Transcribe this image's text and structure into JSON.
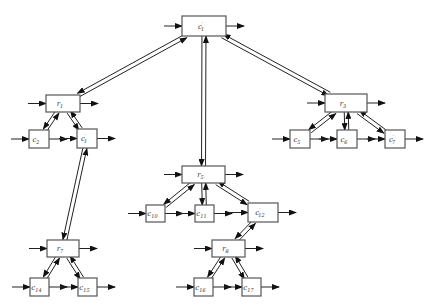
{
  "diagram": {
    "type": "hierarchical-tree",
    "nodes": [
      {
        "id": "c1p_top",
        "base": "c",
        "sub": "1",
        "prime": true,
        "x": 182,
        "y": 16,
        "w": 44,
        "h": 20
      },
      {
        "id": "r1",
        "base": "r",
        "sub": "1",
        "prime": false,
        "x": 46,
        "y": 95,
        "w": 34,
        "h": 17
      },
      {
        "id": "r3",
        "base": "r",
        "sub": "3",
        "prime": false,
        "x": 325,
        "y": 94,
        "w": 42,
        "h": 18
      },
      {
        "id": "r5",
        "base": "r",
        "sub": "5",
        "prime": false,
        "x": 182,
        "y": 166,
        "w": 43,
        "h": 17
      },
      {
        "id": "c2",
        "base": "c",
        "sub": "2",
        "prime": false,
        "x": 29,
        "y": 130,
        "w": 20,
        "h": 18
      },
      {
        "id": "c1p",
        "base": "c",
        "sub": "1",
        "prime": true,
        "x": 77,
        "y": 129,
        "w": 20,
        "h": 19
      },
      {
        "id": "c5",
        "base": "c",
        "sub": "5",
        "prime": false,
        "x": 290,
        "y": 130,
        "w": 20,
        "h": 18
      },
      {
        "id": "c6",
        "base": "c",
        "sub": "6",
        "prime": false,
        "x": 337,
        "y": 130,
        "w": 20,
        "h": 18
      },
      {
        "id": "c7p",
        "base": "c",
        "sub": "7",
        "prime": true,
        "x": 385,
        "y": 130,
        "w": 20,
        "h": 18
      },
      {
        "id": "c10",
        "base": "c",
        "sub": "10",
        "prime": false,
        "x": 146,
        "y": 205,
        "w": 19,
        "h": 17
      },
      {
        "id": "c11",
        "base": "c",
        "sub": "11",
        "prime": false,
        "x": 195,
        "y": 205,
        "w": 19,
        "h": 17
      },
      {
        "id": "c12p",
        "base": "c",
        "sub": "12",
        "prime": true,
        "x": 248,
        "y": 203,
        "w": 30,
        "h": 19
      },
      {
        "id": "r7",
        "base": "r",
        "sub": "7",
        "prime": false,
        "x": 47,
        "y": 240,
        "w": 32,
        "h": 17
      },
      {
        "id": "r8",
        "base": "r",
        "sub": "8",
        "prime": false,
        "x": 212,
        "y": 240,
        "w": 33,
        "h": 17
      },
      {
        "id": "c14",
        "base": "c",
        "sub": "14",
        "prime": false,
        "x": 30,
        "y": 278,
        "w": 19,
        "h": 18
      },
      {
        "id": "c15",
        "base": "c",
        "sub": "15",
        "prime": false,
        "x": 78,
        "y": 278,
        "w": 19,
        "h": 18
      },
      {
        "id": "c16",
        "base": "c",
        "sub": "16",
        "prime": false,
        "x": 194,
        "y": 278,
        "w": 19,
        "h": 18
      },
      {
        "id": "c17",
        "base": "c",
        "sub": "17",
        "prime": false,
        "x": 242,
        "y": 278,
        "w": 19,
        "h": 18
      }
    ],
    "edges": [
      {
        "from": "c1p_top",
        "to": "r1",
        "bidirectional": true
      },
      {
        "from": "c1p_top",
        "to": "r3",
        "bidirectional": true
      },
      {
        "from": "c1p_top",
        "to": "r5",
        "bidirectional": true
      },
      {
        "from": "r1",
        "to": "c2",
        "bidirectional": true
      },
      {
        "from": "r1",
        "to": "c1p",
        "bidirectional": true
      },
      {
        "from": "c1p",
        "to": "r7",
        "bidirectional": true
      },
      {
        "from": "r3",
        "to": "c5",
        "bidirectional": true
      },
      {
        "from": "r3",
        "to": "c6",
        "bidirectional": true
      },
      {
        "from": "r3",
        "to": "c7p",
        "bidirectional": true
      },
      {
        "from": "r5",
        "to": "c10",
        "bidirectional": true
      },
      {
        "from": "r5",
        "to": "c11",
        "bidirectional": true
      },
      {
        "from": "r5",
        "to": "c12p",
        "bidirectional": true
      },
      {
        "from": "c12p",
        "to": "r8",
        "bidirectional": true
      },
      {
        "from": "r7",
        "to": "c14",
        "bidirectional": true
      },
      {
        "from": "r7",
        "to": "c15",
        "bidirectional": true
      },
      {
        "from": "r8",
        "to": "c16",
        "bidirectional": true
      },
      {
        "from": "r8",
        "to": "c17",
        "bidirectional": true
      }
    ],
    "io_arrows": "each node has an incoming arrow on the left and an outgoing arrow on the right",
    "colors": {
      "stroke": "#222222",
      "box_border": "#555555",
      "background": "#ffffff"
    }
  }
}
